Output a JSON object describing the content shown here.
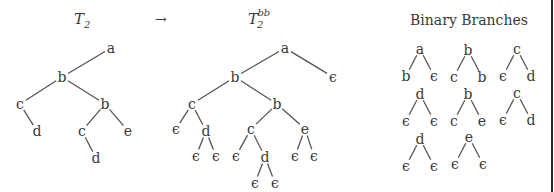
{
  "headers": {
    "left_title": "T",
    "left_sub": "2",
    "arrow": "→",
    "mid_title": "T",
    "mid_sub": "2",
    "mid_sup": "bb",
    "right_title": "Binary Branches"
  },
  "colors": {
    "text": "#3a3a3a",
    "edge": "#555555",
    "border": "#2a2a2a"
  },
  "tree_T2": {
    "nodes": [
      {
        "id": "a",
        "label": "a",
        "x": 111,
        "y": 48
      },
      {
        "id": "b1",
        "label": "b",
        "x": 62,
        "y": 77
      },
      {
        "id": "c1",
        "label": "c",
        "x": 20,
        "y": 104
      },
      {
        "id": "d1",
        "label": "d",
        "x": 37,
        "y": 131
      },
      {
        "id": "b2",
        "label": "b",
        "x": 105,
        "y": 104
      },
      {
        "id": "c2",
        "label": "c",
        "x": 82,
        "y": 131
      },
      {
        "id": "e1",
        "label": "e",
        "x": 128,
        "y": 131
      },
      {
        "id": "d2",
        "label": "d",
        "x": 96,
        "y": 158
      }
    ],
    "edges": [
      [
        "a",
        "b1"
      ],
      [
        "b1",
        "c1"
      ],
      [
        "c1",
        "d1"
      ],
      [
        "b1",
        "b2"
      ],
      [
        "b2",
        "c2"
      ],
      [
        "b2",
        "e1"
      ],
      [
        "c2",
        "d2"
      ]
    ]
  },
  "tree_T2bb": {
    "nodes": [
      {
        "id": "a",
        "label": "a",
        "x": 285,
        "y": 48
      },
      {
        "id": "ea",
        "label": "ϵ",
        "x": 333,
        "y": 77
      },
      {
        "id": "b1",
        "label": "b",
        "x": 235,
        "y": 77
      },
      {
        "id": "c1",
        "label": "c",
        "x": 192,
        "y": 104
      },
      {
        "id": "ec1",
        "label": "ϵ",
        "x": 176,
        "y": 129
      },
      {
        "id": "d1",
        "label": "d",
        "x": 206,
        "y": 131
      },
      {
        "id": "ed1l",
        "label": "ϵ",
        "x": 196,
        "y": 156
      },
      {
        "id": "ed1r",
        "label": "ϵ",
        "x": 216,
        "y": 156
      },
      {
        "id": "b2",
        "label": "b",
        "x": 277,
        "y": 104
      },
      {
        "id": "c2",
        "label": "c",
        "x": 251,
        "y": 129
      },
      {
        "id": "ec2",
        "label": "ϵ",
        "x": 236,
        "y": 156
      },
      {
        "id": "d2",
        "label": "d",
        "x": 265,
        "y": 157
      },
      {
        "id": "ed2l",
        "label": "ϵ",
        "x": 255,
        "y": 183
      },
      {
        "id": "ed2r",
        "label": "ϵ",
        "x": 275,
        "y": 183
      },
      {
        "id": "e1",
        "label": "e",
        "x": 305,
        "y": 129
      },
      {
        "id": "ee1l",
        "label": "ϵ",
        "x": 295,
        "y": 156
      },
      {
        "id": "ee1r",
        "label": "ϵ",
        "x": 314,
        "y": 156
      }
    ],
    "edges": [
      [
        "a",
        "b1"
      ],
      [
        "a",
        "ea"
      ],
      [
        "b1",
        "c1"
      ],
      [
        "b1",
        "b2"
      ],
      [
        "c1",
        "ec1"
      ],
      [
        "c1",
        "d1"
      ],
      [
        "d1",
        "ed1l"
      ],
      [
        "d1",
        "ed1r"
      ],
      [
        "b2",
        "c2"
      ],
      [
        "b2",
        "e1"
      ],
      [
        "c2",
        "ec2"
      ],
      [
        "c2",
        "d2"
      ],
      [
        "d2",
        "ed2l"
      ],
      [
        "d2",
        "ed2r"
      ],
      [
        "e1",
        "ee1l"
      ],
      [
        "e1",
        "ee1r"
      ]
    ]
  },
  "binary_branches": [
    {
      "root": "a",
      "left": "b",
      "right": "ϵ",
      "x": 420,
      "y": 49
    },
    {
      "root": "b",
      "left": "c",
      "right": "b",
      "x": 468,
      "y": 50
    },
    {
      "root": "c",
      "left": "ϵ",
      "right": "d",
      "x": 517,
      "y": 49
    },
    {
      "root": "d",
      "left": "ϵ",
      "right": "ϵ",
      "x": 420,
      "y": 94
    },
    {
      "root": "b",
      "left": "c",
      "right": "e",
      "x": 468,
      "y": 94
    },
    {
      "root": "c",
      "left": "ϵ",
      "right": "d",
      "x": 517,
      "y": 93
    },
    {
      "root": "d",
      "left": "ϵ",
      "right": "ϵ",
      "x": 420,
      "y": 139
    },
    {
      "root": "e",
      "left": "ϵ",
      "right": "ϵ",
      "x": 469,
      "y": 137
    }
  ]
}
